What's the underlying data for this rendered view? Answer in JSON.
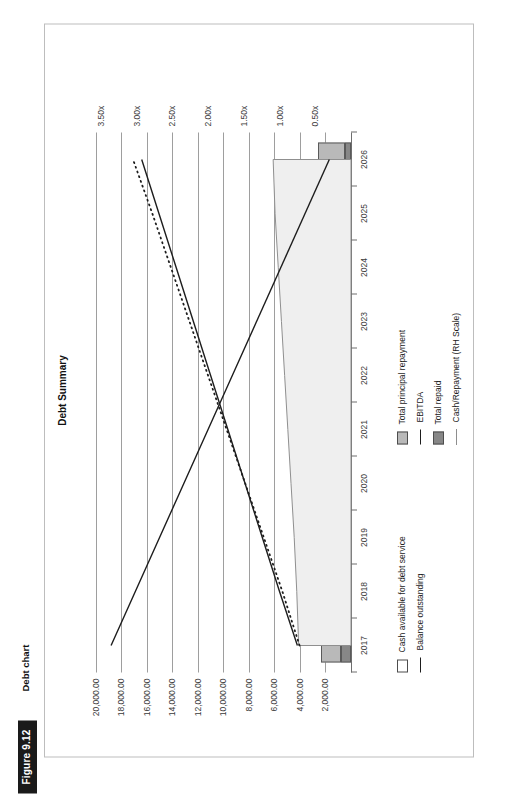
{
  "figure": {
    "badge": "Figure 9.12",
    "caption": "Debt chart"
  },
  "chart_data": {
    "type": "bar",
    "title": "Debt Summary",
    "xlabel": "",
    "ylabel": "",
    "grid": true,
    "legend_position": "bottom",
    "categories": [
      "2017",
      "2018",
      "2019",
      "2020",
      "2021",
      "2022",
      "2023",
      "2024",
      "2025",
      "2026"
    ],
    "left_axis": {
      "label": "",
      "ticks": [
        "2,000.00",
        "4,000.00",
        "6,000.00",
        "8,000.00",
        "10,000.00",
        "12,000.00",
        "14,000.00",
        "16,000.00",
        "18,000.00",
        "20,000.00"
      ],
      "values": [
        2000,
        4000,
        6000,
        8000,
        10000,
        12000,
        14000,
        16000,
        18000,
        20000
      ],
      "ylim": [
        0,
        21000
      ]
    },
    "right_axis": {
      "label": "RH Scale",
      "ticks": [
        "0.50x",
        "1.00x",
        "1.50x",
        "2.00x",
        "2.50x",
        "3.00x",
        "3.50x"
      ],
      "values": [
        0.5,
        1.0,
        1.5,
        2.0,
        2.5,
        3.0,
        3.5
      ],
      "ylim": [
        0,
        3.75
      ]
    },
    "series": [
      {
        "name": "Cash available for debt service",
        "type": "area",
        "axis": "left",
        "color": "#efefef",
        "values": [
          4100,
          4250,
          4450,
          4700,
          4950,
          5200,
          5450,
          5700,
          5950,
          6100
        ]
      },
      {
        "name": "Total principal repayment",
        "type": "bar",
        "axis": "left",
        "color": "#b9b9b9",
        "values": [
          1500,
          1620,
          1700,
          1780,
          1820,
          1900,
          1980,
          2050,
          2120,
          2180
        ]
      },
      {
        "name": "Total repaid",
        "type": "bar",
        "axis": "left",
        "color": "#878787",
        "values": [
          820,
          880,
          780,
          700,
          640,
          600,
          560,
          520,
          480,
          440
        ]
      },
      {
        "name": "Balance outstanding",
        "type": "line",
        "axis": "left",
        "color": "#1d1d1d",
        "values": [
          18800,
          16900,
          15000,
          13100,
          11200,
          9300,
          7400,
          5500,
          3600,
          1700
        ]
      },
      {
        "name": "EBITDA",
        "type": "line",
        "axis": "left",
        "color": "#1d1d1d",
        "values": [
          4200,
          5600,
          6950,
          8300,
          9650,
          11000,
          12350,
          13700,
          15050,
          16400
        ]
      },
      {
        "name": "Cash/Repayment (RH Scale)",
        "type": "line-dotted",
        "axis": "right",
        "color": "#1d1d1d",
        "values": [
          0.72,
          0.96,
          1.22,
          1.48,
          1.74,
          2.0,
          2.26,
          2.52,
          2.78,
          3.05
        ]
      }
    ]
  },
  "legend": {
    "items": [
      {
        "label": "Cash available for debt service",
        "marker": "box-white"
      },
      {
        "label": "Total principal repayment",
        "marker": "box-light-gray"
      },
      {
        "label": "Total repaid",
        "marker": "box-dark-gray"
      },
      {
        "label": "Balance outstanding",
        "marker": "solid-line"
      },
      {
        "label": "EBITDA",
        "marker": "solid-line"
      },
      {
        "label": "Cash/Repayment (RH Scale)",
        "marker": "dotted-line"
      }
    ]
  },
  "colors": {
    "principal": "#b9b9b9",
    "repaid": "#878787",
    "cash_area": "#efefef",
    "line": "#1d1d1d",
    "grid": "#9e9e9e",
    "frame": "#bdbdbd"
  }
}
